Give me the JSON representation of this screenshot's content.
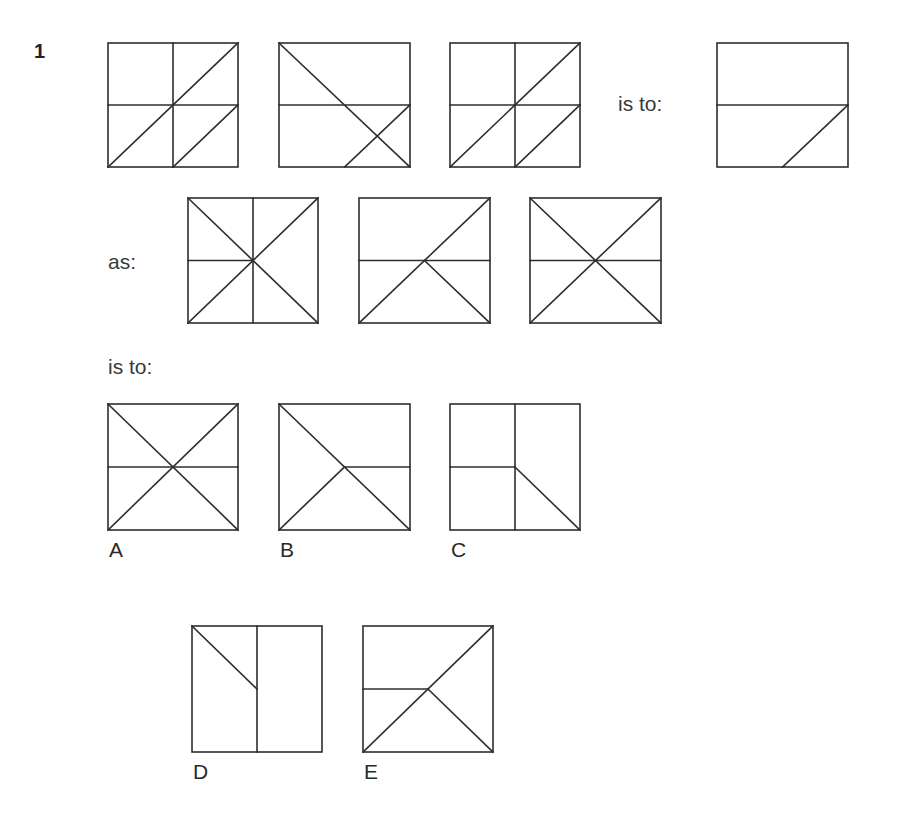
{
  "question": {
    "number": "1",
    "phrase_is_to_1": "is to:",
    "phrase_as": "as:",
    "phrase_is_to_2": "is to:"
  },
  "figures": {
    "row1": [
      {
        "id": "r1f1",
        "x": 108,
        "y": 43,
        "w": 130,
        "h": 124,
        "lines": [
          [
            0.5,
            0,
            0.5,
            1
          ],
          [
            0,
            0.5,
            1,
            0.5
          ],
          [
            0,
            1,
            1,
            0
          ],
          [
            0.5,
            1,
            1,
            0.5
          ]
        ]
      },
      {
        "id": "r1f2",
        "x": 279,
        "y": 43,
        "w": 131,
        "h": 124,
        "lines": [
          [
            0,
            0.5,
            1,
            0.5
          ],
          [
            0,
            0,
            1,
            1
          ],
          [
            0.5,
            1,
            1,
            0.5
          ]
        ]
      },
      {
        "id": "r1f3",
        "x": 450,
        "y": 43,
        "w": 130,
        "h": 124,
        "lines": [
          [
            0.5,
            0,
            0.5,
            1
          ],
          [
            0,
            0.5,
            1,
            0.5
          ],
          [
            0,
            1,
            1,
            0
          ],
          [
            0.5,
            1,
            1,
            0.5
          ]
        ]
      },
      {
        "id": "r1f4",
        "x": 717,
        "y": 43,
        "w": 131,
        "h": 124,
        "lines": [
          [
            0,
            0.5,
            1,
            0.5
          ],
          [
            0.5,
            1,
            1,
            0.5
          ]
        ]
      }
    ],
    "row2": [
      {
        "id": "r2f1",
        "x": 188,
        "y": 198,
        "w": 130,
        "h": 125,
        "lines": [
          [
            0.5,
            0,
            0.5,
            1
          ],
          [
            0,
            0.5,
            0.5,
            0.5
          ],
          [
            0,
            0,
            1,
            1
          ],
          [
            0,
            1,
            1,
            0
          ]
        ]
      },
      {
        "id": "r2f2",
        "x": 359,
        "y": 198,
        "w": 131,
        "h": 125,
        "lines": [
          [
            0,
            0.5,
            1,
            0.5
          ],
          [
            0,
            1,
            1,
            0
          ],
          [
            0.5,
            0.5,
            1,
            1
          ]
        ]
      },
      {
        "id": "r2f3",
        "x": 530,
        "y": 198,
        "w": 131,
        "h": 125,
        "lines": [
          [
            0,
            0.5,
            1,
            0.5
          ],
          [
            0,
            0,
            1,
            1
          ],
          [
            0,
            1,
            1,
            0
          ]
        ]
      }
    ],
    "options": [
      {
        "id": "A",
        "label": "A",
        "x": 108,
        "y": 404,
        "w": 130,
        "h": 126,
        "lines": [
          [
            0,
            0.5,
            1,
            0.5
          ],
          [
            0,
            0,
            1,
            1
          ],
          [
            0,
            1,
            1,
            0
          ]
        ]
      },
      {
        "id": "B",
        "label": "B",
        "x": 279,
        "y": 404,
        "w": 131,
        "h": 126,
        "lines": [
          [
            0.5,
            0.5,
            1,
            0.5
          ],
          [
            0,
            0,
            1,
            1
          ],
          [
            0,
            1,
            0.5,
            0.5
          ]
        ]
      },
      {
        "id": "C",
        "label": "C",
        "x": 450,
        "y": 404,
        "w": 130,
        "h": 126,
        "lines": [
          [
            0.5,
            0,
            0.5,
            1
          ],
          [
            0,
            0.5,
            0.5,
            0.5
          ],
          [
            0.5,
            0.5,
            1,
            1
          ]
        ]
      },
      {
        "id": "D",
        "label": "D",
        "x": 192,
        "y": 626,
        "w": 130,
        "h": 126,
        "lines": [
          [
            0.5,
            0,
            0.5,
            1
          ],
          [
            0,
            0,
            0.5,
            0.5
          ]
        ]
      },
      {
        "id": "E",
        "label": "E",
        "x": 363,
        "y": 626,
        "w": 130,
        "h": 126,
        "lines": [
          [
            0,
            0.5,
            0.5,
            0.5
          ],
          [
            0,
            1,
            1,
            0
          ],
          [
            0.5,
            0.5,
            1,
            1
          ]
        ]
      }
    ]
  }
}
